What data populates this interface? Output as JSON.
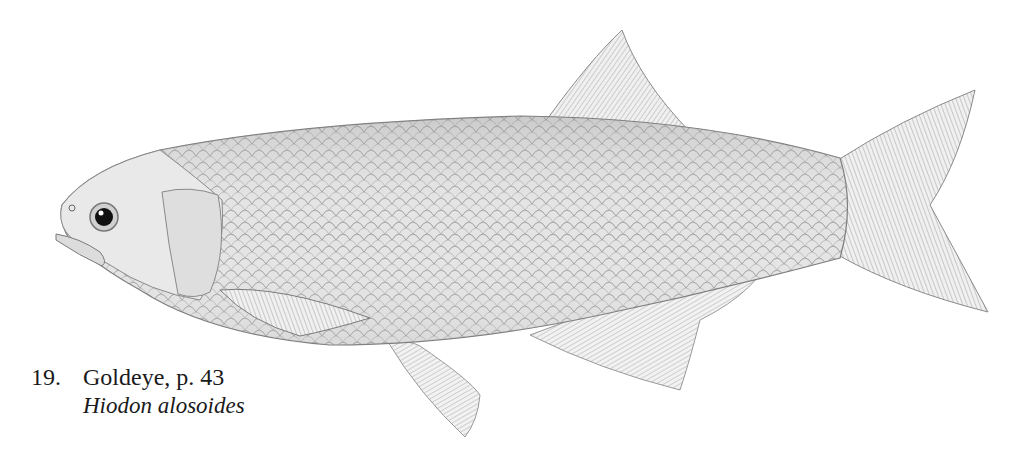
{
  "plate": {
    "subject": "fish illustration",
    "style": "pencil / graphite scientific illustration",
    "colors": {
      "background": "#ffffff",
      "body_light": "#e8e8e8",
      "body_mid": "#c4c4c4",
      "outline": "#7a7a7a",
      "eye": "#111111"
    }
  },
  "caption": {
    "number": "19.",
    "common_name": "Goldeye, p. 43",
    "scientific_name": "Hiodon alosoides"
  }
}
